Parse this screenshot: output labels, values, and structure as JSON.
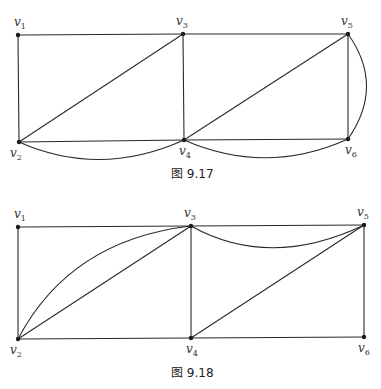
{
  "figures": [
    {
      "caption": "图 9.17",
      "vertices": [
        {
          "id": "v1",
          "name": "v",
          "sub": "1",
          "x": 18,
          "y": 35
        },
        {
          "id": "v2",
          "name": "v",
          "sub": "2",
          "x": 19,
          "y": 142
        },
        {
          "id": "v3",
          "name": "v",
          "sub": "3",
          "x": 183,
          "y": 34
        },
        {
          "id": "v4",
          "name": "v",
          "sub": "4",
          "x": 184,
          "y": 140
        },
        {
          "id": "v5",
          "name": "v",
          "sub": "5",
          "x": 348,
          "y": 34
        },
        {
          "id": "v6",
          "name": "v",
          "sub": "6",
          "x": 348,
          "y": 139
        }
      ],
      "edges": [
        [
          "v1",
          "v3"
        ],
        [
          "v3",
          "v5"
        ],
        [
          "v1",
          "v2"
        ],
        [
          "v3",
          "v4"
        ],
        [
          "v5",
          "v6"
        ],
        [
          "v2",
          "v4"
        ],
        [
          "v4",
          "v6"
        ],
        [
          "v2",
          "v3"
        ],
        [
          "v4",
          "v5"
        ],
        [
          "v2",
          "v4",
          "curve"
        ],
        [
          "v4",
          "v6",
          "curve"
        ],
        [
          "v5",
          "v6",
          "curve"
        ]
      ]
    },
    {
      "caption": "图 9.18",
      "vertices": [
        {
          "id": "v1",
          "name": "v",
          "sub": "1",
          "x": 18,
          "y": 227
        },
        {
          "id": "v2",
          "name": "v",
          "sub": "2",
          "x": 18,
          "y": 339
        },
        {
          "id": "v3",
          "name": "v",
          "sub": "3",
          "x": 191,
          "y": 226
        },
        {
          "id": "v4",
          "name": "v",
          "sub": "4",
          "x": 191,
          "y": 338
        },
        {
          "id": "v5",
          "name": "v",
          "sub": "5",
          "x": 364,
          "y": 225
        },
        {
          "id": "v6",
          "name": "v",
          "sub": "6",
          "x": 364,
          "y": 337
        }
      ],
      "edges": [
        [
          "v1",
          "v3"
        ],
        [
          "v3",
          "v5"
        ],
        [
          "v1",
          "v2"
        ],
        [
          "v3",
          "v4"
        ],
        [
          "v5",
          "v6"
        ],
        [
          "v2",
          "v4"
        ],
        [
          "v4",
          "v6"
        ],
        [
          "v2",
          "v3"
        ],
        [
          "v4",
          "v5"
        ],
        [
          "v2",
          "v3",
          "curve"
        ],
        [
          "v3",
          "v5",
          "curve"
        ]
      ]
    }
  ]
}
